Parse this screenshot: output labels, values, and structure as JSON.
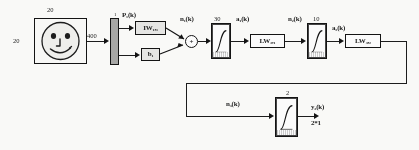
{
  "diagram": {
    "input": {
      "image_label_top": "20",
      "image_label_left": "20",
      "icon": "smiley-face-icon",
      "vector_size": "400",
      "input_bar_label": "1"
    },
    "signals": {
      "p1": "P₁(k)",
      "n1": "n₁(k)",
      "a1": "a₁(k)",
      "n2": "n₂(k)",
      "a2": "a₂(k)",
      "n3": "n₃(k)",
      "y3": "y₃(k)",
      "output_dim": "2*1"
    },
    "blocks": {
      "iw": "IW₁,₁",
      "bias": "b₁",
      "lw21": "LW₂,₁",
      "lw32": "LW₃,₂",
      "sum": "+"
    },
    "layer_sizes": {
      "layer1": "30",
      "layer2": "10",
      "layer3": "2"
    },
    "transfer_functions": {
      "tf1": "log-sigmoid-icon",
      "tf2": "log-sigmoid-icon",
      "tf3": "log-sigmoid-icon"
    },
    "colors": {
      "ink": "#1a1a1a",
      "block_fill": "#e8e8e6",
      "bar_fill": "#a8a8a6",
      "paper": "#fdfdfb"
    }
  }
}
